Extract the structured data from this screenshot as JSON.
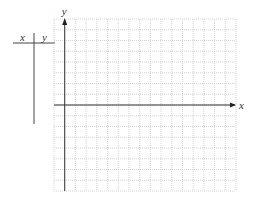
{
  "table": {
    "col_x_label": "x",
    "col_y_label": "y"
  },
  "graph": {
    "x_axis_label": "x",
    "y_axis_label": "y",
    "grid": {
      "columns": 17,
      "rows": 16,
      "y_axis_column": 1,
      "x_axis_row": 8,
      "line_color": "#c8c8c8",
      "axis_color": "#333333"
    }
  }
}
